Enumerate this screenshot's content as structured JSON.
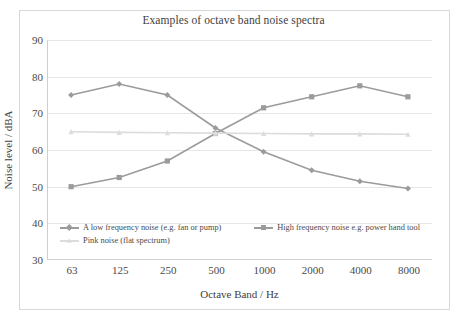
{
  "chart_data": {
    "type": "line",
    "title": "Examples of octave band noise spectra",
    "xlabel": "Octave Band / Hz",
    "ylabel": "Noise level / dBA",
    "categories": [
      "63",
      "125",
      "250",
      "500",
      "1000",
      "2000",
      "4000",
      "8000"
    ],
    "ylim": [
      30,
      90
    ],
    "yticks": [
      30,
      40,
      50,
      60,
      70,
      80,
      90
    ],
    "grid": true,
    "legend_position": "bottom-inside",
    "series": [
      {
        "name": "A low frequency noise (e.g. fan or pump)",
        "color": "#9b9b9b",
        "marker": "diamond",
        "values": [
          75,
          78,
          75,
          66,
          59.5,
          54.5,
          51.5,
          49.5
        ]
      },
      {
        "name": "High frequency noise e.g. power hand tool",
        "color": "#9b9b9b",
        "marker": "square",
        "values": [
          50,
          52.5,
          57,
          64.5,
          71.5,
          74.5,
          77.5,
          74.5
        ]
      },
      {
        "name": "Pink noise (flat spectrum)",
        "color": "#dcdcdc",
        "marker": "triangle",
        "values": [
          65,
          64.8,
          64.7,
          64.6,
          64.5,
          64.4,
          64.4,
          64.3
        ]
      }
    ]
  },
  "legend": {
    "items": [
      "A low frequency noise (e.g. fan or pump)",
      "High frequency noise e.g. power hand tool",
      "Pink noise (flat spectrum)"
    ]
  },
  "colors": {
    "series_gray": "#9b9b9b",
    "series_pink": "#dcdcdc",
    "gridline": "#e6e6e6",
    "axis": "#cfcfcf",
    "frame": "#d8d8d8",
    "text": "#3e3e3e"
  }
}
